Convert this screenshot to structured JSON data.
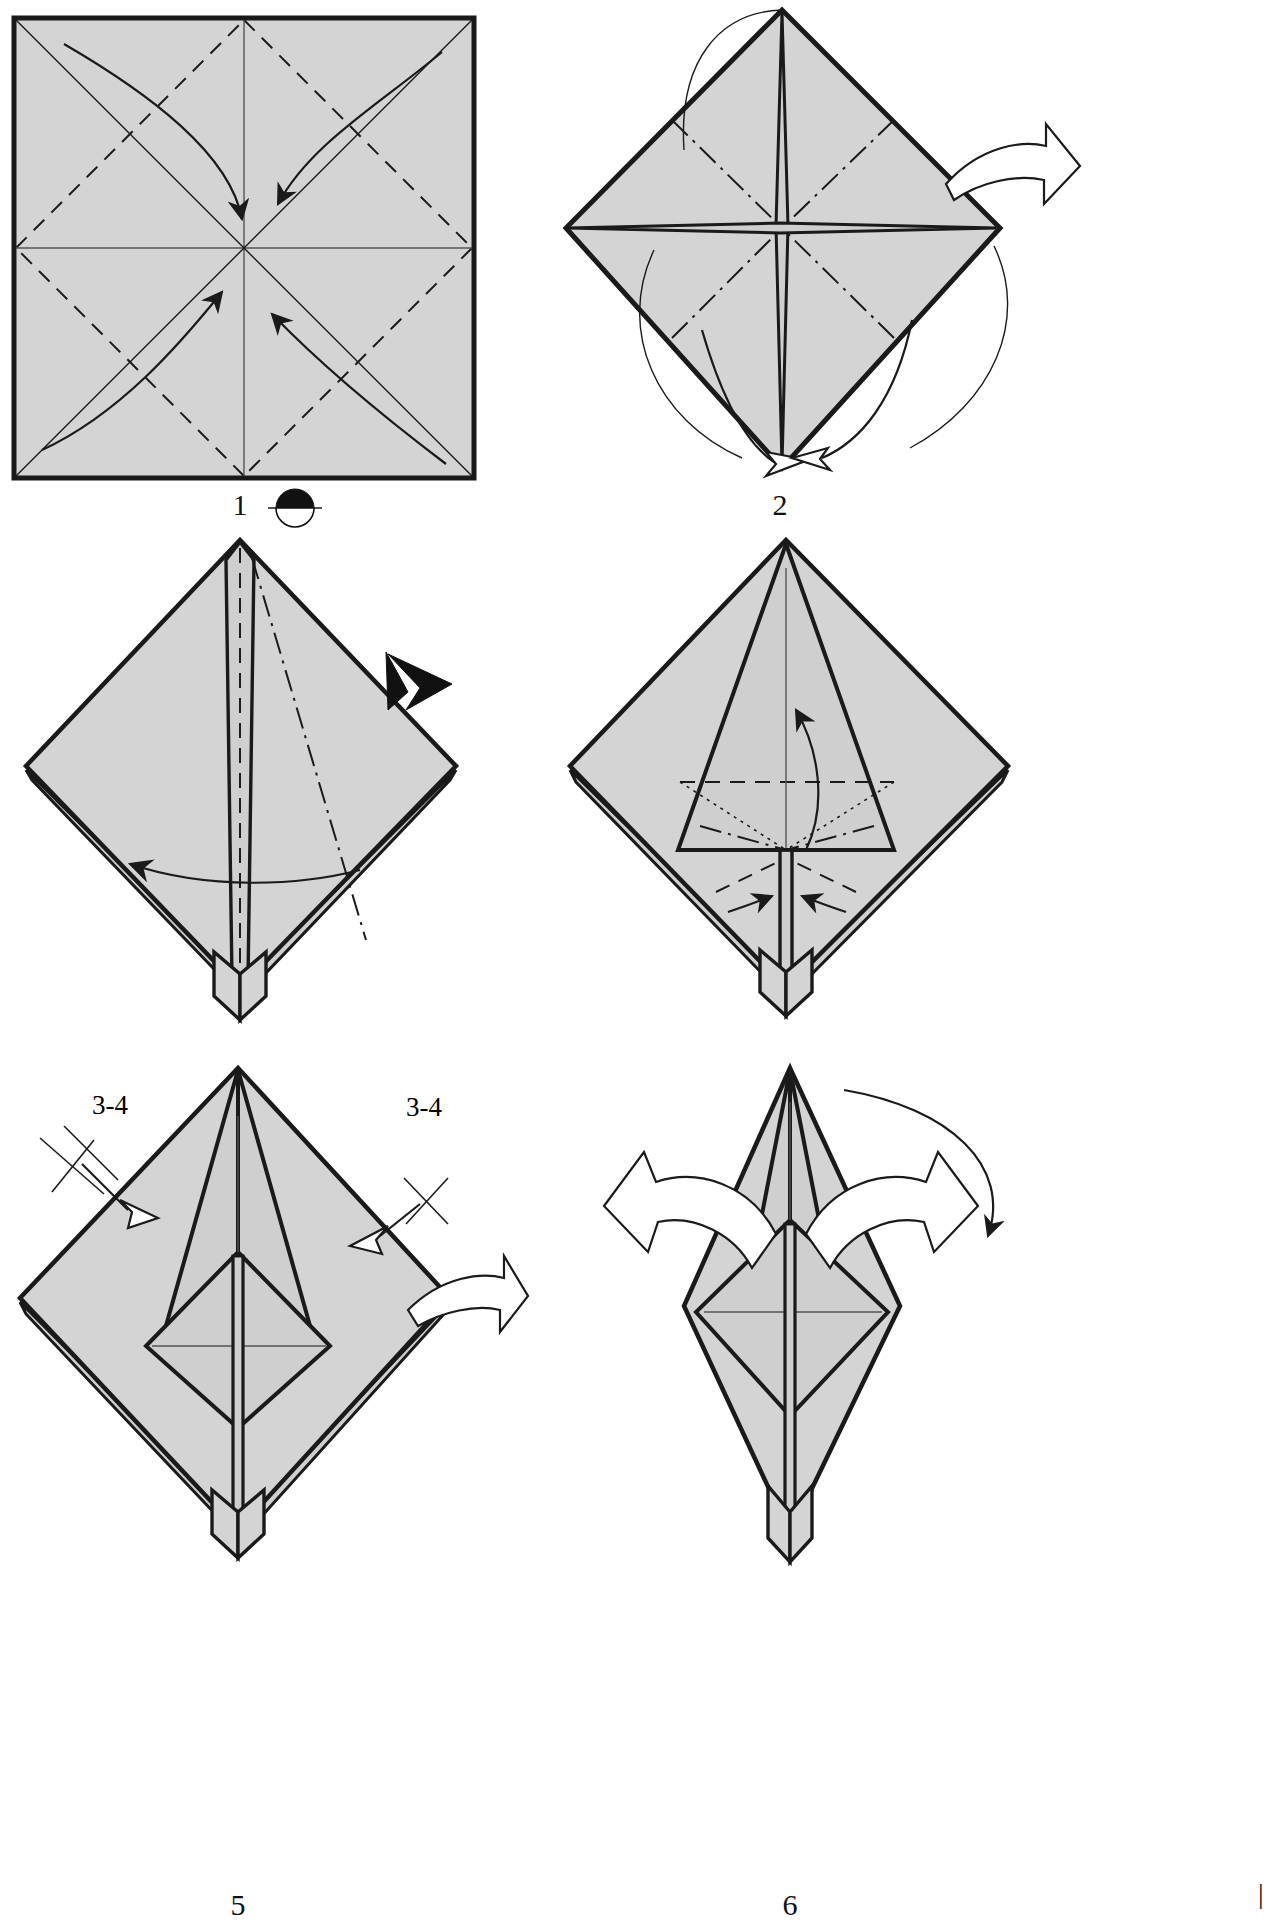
{
  "document": {
    "kind": "origami-folding-instructions",
    "page_background": "#ffffff",
    "paper_fill": "#d4d4d4",
    "line_color": "#1a1a1a"
  },
  "steps": [
    {
      "number": "1",
      "label": "1",
      "shape": "square",
      "symbol": "half-black-circle-turn-over-and-rotate",
      "creases": [
        "valley-diagonals",
        "mountain-center-vertical",
        "mountain-center-horizontal"
      ],
      "arrows": 4,
      "arrow_kind": "curved-thin-inward",
      "description": "Square sheet with diagonal valley creases and centre mountain creases; four curved arrows fold the corners to the centre."
    },
    {
      "number": "2",
      "label": "2",
      "shape": "diamond-preliminary-base",
      "symbol": "turn-over-arrow",
      "creases": [
        "mountain-diagonals",
        "valley-horizontal-center"
      ],
      "arrows": 4,
      "arrow_kind": "curved-thin-and-hollow-tip",
      "description": "Blintzed diamond with a four pointed star of raw edges at the centre; arrows wrap the left and right flaps to the bottom point."
    },
    {
      "number": "3",
      "label": "3",
      "shape": "diamond-layers",
      "symbol": "solid-black-push-arrow",
      "creases": [
        "valley-center-vertical",
        "mountain-right-diagonal"
      ],
      "arrows": 1,
      "arrow_kind": "thin-sweep-left",
      "description": "Layered diamond; a black solid arrowhead pushes the right flap while a long thin arrow swings a layer to the left."
    },
    {
      "number": "4",
      "label": "4",
      "shape": "diamond-with-inner-triangle",
      "symbol": "",
      "creases": [
        "valley-horizontal",
        "mountain-inner-v",
        "dotted-hidden-diagonals"
      ],
      "arrows": 3,
      "arrow_kind": "thin-up-and-two-inward",
      "description": "Diamond with an inner square/triangle panel; one arrow lifts the flap up, two small arrows squeeze the sides inward."
    },
    {
      "number": "5",
      "label": "5",
      "symbol": "turn-over-arrow",
      "annotations": [
        "3-4",
        "3-4"
      ],
      "annotation_marks": [
        "double-tick-repeat",
        "single-tick-repeat"
      ],
      "arrows": 3,
      "arrow_kind": "hollow-repeat-arrows-and-turn-over",
      "description": "Kite shape with an inner diamond; two hollow repeat arrows labelled 3-4 mark repeating steps three to four on both sides, plus a turn-over arrow on the right."
    },
    {
      "number": "6",
      "label": "6",
      "symbol": "",
      "arrows": 3,
      "arrow_kind": "two-large-hollow-outward-and-one-thin-curve",
      "description": "Narrow spike with inner diamond; two large hollow arrows pull the flaps outward and a thin curved arrow loops to the right."
    }
  ],
  "page_corner_marks": {
    "bottom_right": "|"
  }
}
